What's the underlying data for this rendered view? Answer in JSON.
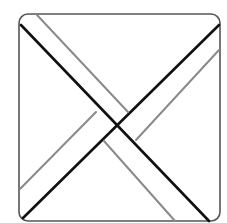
{
  "diagram": {
    "title": "",
    "frame": {
      "x": 19,
      "y": 14,
      "width": 201,
      "height": 207,
      "radius": 9,
      "stroke": "#555555",
      "stroke_width": 1.6
    },
    "colors": {
      "background": "#ffffff",
      "primary_line": "#111111",
      "secondary_line": "#8a8a8a"
    },
    "lines": [
      {
        "id": "black-diagonal-tl-br",
        "x1": 21,
        "y1": 25,
        "x2": 209,
        "y2": 221,
        "color": "#111111",
        "width": 2.6
      },
      {
        "id": "black-diagonal-bl-tr",
        "x1": 23,
        "y1": 218,
        "x2": 219,
        "y2": 25,
        "color": "#111111",
        "width": 2.6
      },
      {
        "id": "gray-upper-tl-segment",
        "x1": 37,
        "y1": 15,
        "x2": 128,
        "y2": 112,
        "color": "#8a8a8a",
        "width": 2
      },
      {
        "id": "gray-lower-br-segment",
        "x1": 104,
        "y1": 141,
        "x2": 175,
        "y2": 221,
        "color": "#8a8a8a",
        "width": 2
      },
      {
        "id": "gray-lower-bl-segment",
        "x1": 20,
        "y1": 189,
        "x2": 96,
        "y2": 112,
        "color": "#8a8a8a",
        "width": 2
      },
      {
        "id": "gray-upper-tr-segment",
        "x1": 136,
        "y1": 140,
        "x2": 219,
        "y2": 50,
        "color": "#8a8a8a",
        "width": 2
      }
    ]
  }
}
